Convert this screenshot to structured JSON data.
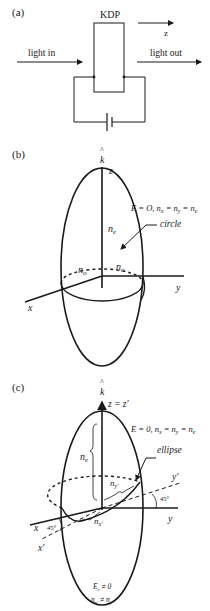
{
  "panel_a": {
    "label": "(a)",
    "crystal": "KDP",
    "axis": "z",
    "input": "light in",
    "output": "light out"
  },
  "panel_b": {
    "label": "(b)",
    "k_hat": "^",
    "k": "k",
    "z_axis": "z",
    "equation": "E = O, n",
    "equation_full": "E = O, nₓ = n_y = nₒ",
    "ne": "n",
    "ne_sub": "e",
    "circle": "circle",
    "no_left": "n",
    "no_left_sub": "o",
    "no_right": "n",
    "no_right_sub": "o",
    "x_axis": "x",
    "y_axis": "y"
  },
  "panel_c": {
    "label": "(c)",
    "k_hat": "^",
    "k": "k",
    "z_axis": "z = z′",
    "equation": "E = 0, nₓ = n_y = nₒ",
    "ne": "n",
    "ne_sub": "e",
    "ellipse": "ellipse",
    "ny_prime": "n",
    "ny_prime_sub": "y′",
    "nx_prime": "n",
    "nx_prime_sub": "x′",
    "y_prime": "y′",
    "y_axis": "y",
    "x_axis": "x",
    "x_prime": "x′",
    "angle1": "45°",
    "angle2": "45°",
    "condition1": "E_z ≠ 0",
    "condition2": "n_x′ ≠ n_y′"
  }
}
